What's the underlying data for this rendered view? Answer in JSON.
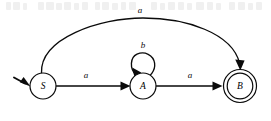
{
  "figure": {
    "width": 271,
    "height": 121,
    "background_color": "#ffffff",
    "ink_color": "#0a0a0a"
  },
  "states": [
    {
      "id": "S",
      "label": "S",
      "role": "start",
      "accepting": false,
      "cx": 43,
      "cy": 86,
      "r": 13
    },
    {
      "id": "A",
      "label": "A",
      "role": "intermediate",
      "accepting": false,
      "cx": 143,
      "cy": 86,
      "r": 13
    },
    {
      "id": "B",
      "label": "B",
      "role": "final",
      "accepting": true,
      "cx": 240,
      "cy": 86,
      "r": 13,
      "r_outer": 16.5
    }
  ],
  "transitions": [
    {
      "id": "s-to-a",
      "from": "S",
      "to": "A",
      "label": "a",
      "shape": "straight",
      "label_x": 86,
      "label_y": 76
    },
    {
      "id": "a-to-a",
      "from": "A",
      "to": "A",
      "label": "b",
      "shape": "self-loop",
      "label_x": 143,
      "label_y": 46
    },
    {
      "id": "a-to-b",
      "from": "A",
      "to": "B",
      "label": "a",
      "shape": "straight",
      "label_x": 190,
      "label_y": 76
    },
    {
      "id": "s-to-b",
      "from": "S",
      "to": "B",
      "label": "a",
      "shape": "arc-over",
      "label_x": 140,
      "label_y": 11
    }
  ],
  "start_marker": {
    "label": "start-arrow",
    "from_x": 14,
    "from_y": 78,
    "to_x": 30,
    "to_y": 85
  },
  "alphabet": [
    "a",
    "b"
  ]
}
